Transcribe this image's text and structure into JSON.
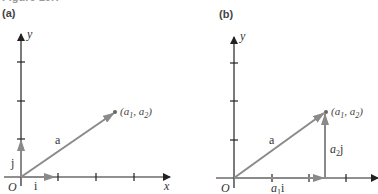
{
  "figure": {
    "title": "Figure 10.?",
    "panels": [
      {
        "label": "(a)",
        "axes": {
          "x_label": "x",
          "y_label": "y",
          "origin_label": "O"
        },
        "vectors": [
          {
            "name": "a",
            "label": "a",
            "from": [
              0,
              0
            ],
            "to": [
              "a1",
              "a2"
            ]
          },
          {
            "name": "i",
            "label": "i",
            "from": [
              0,
              0
            ],
            "to": [
              1,
              0
            ]
          },
          {
            "name": "j",
            "label": "j",
            "from": [
              0,
              0
            ],
            "to": [
              0,
              1
            ]
          }
        ],
        "point": {
          "label_open": "(",
          "a1": "a",
          "sub1": "1",
          "sep": ", ",
          "a2": "a",
          "sub2": "2",
          "label_close": ")"
        }
      },
      {
        "label": "(b)",
        "axes": {
          "x_label": "x",
          "y_label": "y",
          "origin_label": "O"
        },
        "vectors": [
          {
            "name": "a",
            "label": "a",
            "from": [
              0,
              0
            ],
            "to": [
              "a1",
              "a2"
            ]
          },
          {
            "name": "a1i",
            "label_coef": "a",
            "label_sub": "1",
            "label_unit": "i",
            "from": [
              0,
              0
            ],
            "to": [
              "a1",
              0
            ]
          },
          {
            "name": "a2j",
            "label_coef": "a",
            "label_sub": "2",
            "label_unit": "j",
            "from": [
              "a1",
              0
            ],
            "to": [
              "a1",
              "a2"
            ]
          }
        ],
        "point": {
          "label_open": "(",
          "a1": "a",
          "sub1": "1",
          "sep": ", ",
          "a2": "a",
          "sub2": "2",
          "label_close": ")"
        }
      }
    ],
    "colors": {
      "axis": "#222222",
      "vector": "#8a8a8a",
      "text": "#333333"
    }
  }
}
